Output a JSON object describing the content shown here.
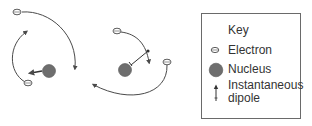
{
  "diagram": {
    "atoms": [
      {
        "id": "atom-left",
        "nucleus": {
          "cx": 49,
          "cy": 71
        },
        "dipole_direction": "left"
      },
      {
        "id": "atom-middle",
        "nucleus": {
          "cx": 124,
          "cy": 70
        },
        "dipole_direction": "up-right"
      }
    ],
    "colors": {
      "line": "#4a4a4a",
      "nucleus_fill": "#6e6e6e",
      "legend_border": "#6a6a6a",
      "text": "#333333"
    }
  },
  "legend": {
    "title": "Key",
    "items": [
      {
        "icon": "electron-icon",
        "label": "Electron"
      },
      {
        "icon": "nucleus-icon",
        "label": "Nucleus"
      },
      {
        "icon": "dipole-arrow-icon",
        "label": "Instantaneous",
        "label2": "dipole"
      }
    ]
  }
}
